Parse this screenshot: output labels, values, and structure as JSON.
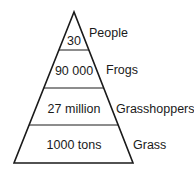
{
  "diagram": {
    "type": "ecological-pyramid-of-numbers",
    "levels": [
      {
        "name": "People",
        "value": "30"
      },
      {
        "name": "Frogs",
        "value": "90 000"
      },
      {
        "name": "Grasshoppers",
        "value": "27 million"
      },
      {
        "name": "Grass",
        "value": "1000 tons"
      }
    ],
    "stroke_color": "#1a1a1a"
  }
}
